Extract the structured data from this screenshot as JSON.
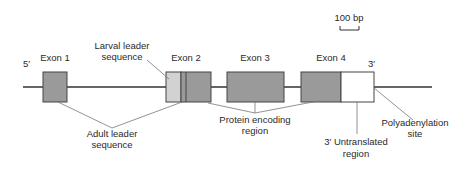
{
  "scale_bar": {
    "label": "100 bp"
  },
  "ends": {
    "five_prime": "5′",
    "three_prime": "3′"
  },
  "exons": [
    {
      "label": "Exon 1"
    },
    {
      "label": "Exon 2"
    },
    {
      "label": "Exon 3"
    },
    {
      "label": "Exon 4"
    }
  ],
  "annotations": {
    "larval_leader": [
      "Larval leader",
      "sequence"
    ],
    "adult_leader": [
      "Adult leader",
      "sequence"
    ],
    "protein_encoding": [
      "Protein encoding",
      "region"
    ],
    "utr": [
      "3′ Untranslated",
      "region"
    ],
    "polyA": [
      "Polyadenylation",
      "site"
    ]
  },
  "colors": {
    "coding": "#9a9a9a",
    "larval": "#d2d2d2",
    "utr": "#ffffff",
    "line": "#333333",
    "leader": "#777777"
  }
}
